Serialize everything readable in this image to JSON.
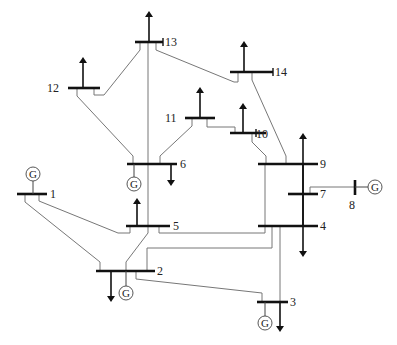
{
  "diagram": {
    "generator_symbol": "G",
    "colors": {
      "bus": "#111111",
      "line": "#777777",
      "background": "#ffffff"
    },
    "buses": [
      {
        "id": "1",
        "label": "1",
        "generator": true,
        "load": null
      },
      {
        "id": "2",
        "label": "2",
        "generator": true,
        "load": "down"
      },
      {
        "id": "3",
        "label": "3",
        "generator": true,
        "load": "down"
      },
      {
        "id": "4",
        "label": "4",
        "generator": false,
        "load": "down"
      },
      {
        "id": "5",
        "label": "5",
        "generator": false,
        "load": "up"
      },
      {
        "id": "6",
        "label": "6",
        "generator": true,
        "load": "down"
      },
      {
        "id": "7",
        "label": "7",
        "generator": false,
        "load": null
      },
      {
        "id": "8",
        "label": "8",
        "generator": true,
        "load": null
      },
      {
        "id": "9",
        "label": "9",
        "generator": false,
        "load": "up"
      },
      {
        "id": "10",
        "label": "10",
        "generator": false,
        "load": "up"
      },
      {
        "id": "11",
        "label": "11",
        "generator": false,
        "load": "up"
      },
      {
        "id": "12",
        "label": "12",
        "generator": false,
        "load": "up"
      },
      {
        "id": "13",
        "label": "13",
        "generator": false,
        "load": "up"
      },
      {
        "id": "14",
        "label": "14",
        "generator": false,
        "load": "up"
      }
    ],
    "branches": [
      [
        "1",
        "2"
      ],
      [
        "1",
        "5"
      ],
      [
        "2",
        "3"
      ],
      [
        "2",
        "4"
      ],
      [
        "2",
        "5"
      ],
      [
        "3",
        "4"
      ],
      [
        "4",
        "5"
      ],
      [
        "4",
        "7"
      ],
      [
        "4",
        "9"
      ],
      [
        "5",
        "6"
      ],
      [
        "6",
        "11"
      ],
      [
        "6",
        "12"
      ],
      [
        "6",
        "13"
      ],
      [
        "7",
        "8"
      ],
      [
        "7",
        "9"
      ],
      [
        "9",
        "10"
      ],
      [
        "9",
        "14"
      ],
      [
        "10",
        "11"
      ],
      [
        "12",
        "13"
      ],
      [
        "13",
        "14"
      ]
    ]
  }
}
